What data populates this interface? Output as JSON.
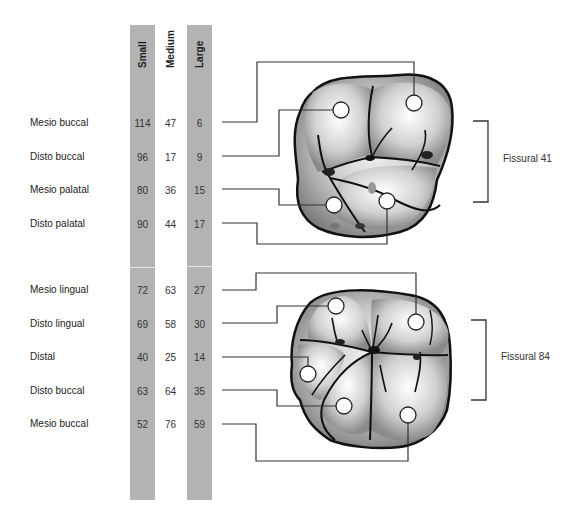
{
  "columns": [
    "Small",
    "Medium",
    "Large"
  ],
  "groups": [
    {
      "fissural_label": "Fissural 41",
      "rows": [
        {
          "label": "Mesio buccal",
          "small": "114",
          "medium": "47",
          "large": "6"
        },
        {
          "label": "Disto buccal",
          "small": "96",
          "medium": "17",
          "large": "9"
        },
        {
          "label": "Mesio palatal",
          "small": "80",
          "medium": "36",
          "large": "15"
        },
        {
          "label": "Disto palatal",
          "small": "90",
          "medium": "44",
          "large": "17"
        }
      ]
    },
    {
      "fissural_label": "Fissural 84",
      "rows": [
        {
          "label": "Mesio lingual",
          "small": "72",
          "medium": "63",
          "large": "27"
        },
        {
          "label": "Disto lingual",
          "small": "69",
          "medium": "58",
          "large": "30"
        },
        {
          "label": "Distal",
          "small": "40",
          "medium": "25",
          "large": "14"
        },
        {
          "label": "Disto buccal",
          "small": "63",
          "medium": "64",
          "large": "35"
        },
        {
          "label": "Mesio buccal",
          "small": "52",
          "medium": "76",
          "large": "59"
        }
      ]
    }
  ],
  "colors": {
    "column_fill": "#b3b3b3",
    "line": "#333333",
    "tooth_outline": "#111111"
  }
}
